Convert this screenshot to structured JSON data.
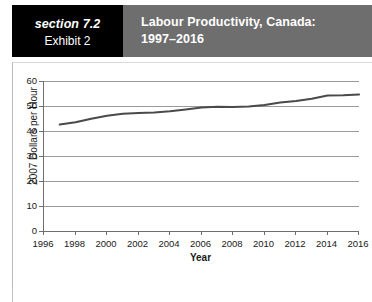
{
  "header": {
    "section_label": "section 7.2",
    "exhibit_label": "Exhibit 2",
    "title_line1": "Labour Productivity, Canada:",
    "title_line2": "1997–2016",
    "section_block_color": "#000000",
    "title_block_color": "#6e6e6e",
    "text_color": "#ffffff"
  },
  "bottom_caption": {
    "text": ""
  },
  "chart_data": {
    "type": "line",
    "xlabel": "Year",
    "ylabel": "2007 Dollars per Hour",
    "xlim": [
      1996,
      2016
    ],
    "ylim": [
      0,
      60
    ],
    "grid": true,
    "legend": "none",
    "line_color": "#4a4a4a",
    "y_ticks": [
      0,
      10,
      20,
      30,
      40,
      50,
      60
    ],
    "x_ticks": [
      1996,
      1998,
      2000,
      2002,
      2004,
      2006,
      2008,
      2010,
      2012,
      2014,
      2016
    ],
    "x_tick_labels": [
      "1996",
      "1998",
      "2000",
      "2002",
      "2004",
      "2006",
      "2008",
      "2010",
      "2012",
      "2014",
      "2016"
    ],
    "y_tick_labels": [
      "0",
      "10",
      "20",
      "30",
      "40",
      "50",
      "60"
    ],
    "series": [
      {
        "name": "Labour productivity",
        "x": [
          1997,
          1998,
          1999,
          2000,
          2001,
          2002,
          2003,
          2004,
          2005,
          2006,
          2007,
          2008,
          2009,
          2010,
          2011,
          2012,
          2013,
          2014,
          2015,
          2016
        ],
        "values": [
          42.6,
          43.5,
          44.9,
          46.1,
          46.9,
          47.2,
          47.4,
          47.9,
          48.6,
          49.4,
          49.7,
          49.6,
          49.8,
          50.4,
          51.4,
          52.0,
          52.9,
          54.2,
          54.3,
          54.6
        ]
      }
    ]
  }
}
